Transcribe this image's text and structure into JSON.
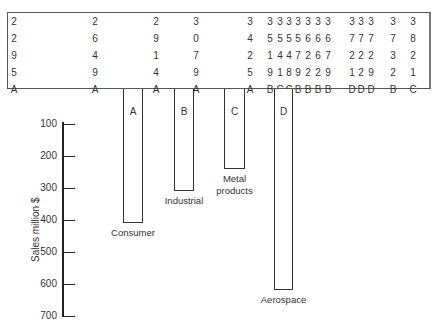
{
  "table": {
    "columns": [
      {
        "x": 14,
        "digits": [
          "2",
          "2",
          "9",
          "5"
        ],
        "letter": "A"
      },
      {
        "x": 95,
        "digits": [
          "2",
          "6",
          "4",
          "9"
        ],
        "letter": "A"
      },
      {
        "x": 156,
        "digits": [
          "2",
          "9",
          "1",
          "4"
        ],
        "letter": "A"
      },
      {
        "x": 196,
        "digits": [
          "3",
          "0",
          "7",
          "9"
        ],
        "letter": "A"
      },
      {
        "x": 250,
        "digits": [
          "3",
          "4",
          "2",
          "5"
        ],
        "letter": "A"
      },
      {
        "x": 270,
        "digits": [
          "3",
          "5",
          "1",
          "9"
        ],
        "letter": "B"
      },
      {
        "x": 280,
        "digits": [
          "3",
          "5",
          "4",
          "1"
        ],
        "letter": "C"
      },
      {
        "x": 289,
        "digits": [
          "3",
          "5",
          "4",
          "8"
        ],
        "letter": "C"
      },
      {
        "x": 298,
        "digits": [
          "3",
          "5",
          "7",
          "9"
        ],
        "letter": "B"
      },
      {
        "x": 308,
        "digits": [
          "3",
          "6",
          "2",
          "2"
        ],
        "letter": "B"
      },
      {
        "x": 318,
        "digits": [
          "3",
          "6",
          "6",
          "2"
        ],
        "letter": "B"
      },
      {
        "x": 328,
        "digits": [
          "3",
          "6",
          "7",
          "9"
        ],
        "letter": "B"
      },
      {
        "x": 352,
        "digits": [
          "3",
          "7",
          "2",
          "1"
        ],
        "letter": "D"
      },
      {
        "x": 361,
        "digits": [
          "3",
          "7",
          "2",
          "2"
        ],
        "letter": "D"
      },
      {
        "x": 371,
        "digits": [
          "3",
          "7",
          "2",
          "9"
        ],
        "letter": "D"
      },
      {
        "x": 393,
        "digits": [
          "3",
          "7",
          "3",
          "2"
        ],
        "letter": "B"
      },
      {
        "x": 413,
        "digits": [
          "3",
          "8",
          "2",
          "1"
        ],
        "letter": "C"
      }
    ]
  },
  "chart_data": {
    "type": "bar",
    "orientation": "hanging-down",
    "title": "",
    "ylabel": "Sales million $",
    "xlabel": "",
    "ylim": [
      0,
      700
    ],
    "yticks": [
      100,
      200,
      300,
      400,
      500,
      600,
      700
    ],
    "categories": [
      "Consumer",
      "Industrial",
      "Metal products",
      "Aerospace"
    ],
    "bar_letters": [
      "A",
      "B",
      "C",
      "D"
    ],
    "values": [
      410,
      310,
      240,
      620
    ],
    "grid": false,
    "legend": null
  },
  "axis": {
    "label": "Sales million $",
    "ticks": [
      "100",
      "200",
      "300",
      "400",
      "500",
      "600",
      "700"
    ]
  },
  "bars": [
    {
      "letter": "A",
      "label": "Consumer",
      "value": 410
    },
    {
      "letter": "B",
      "label": "Industrial",
      "value": 310
    },
    {
      "letter": "C",
      "label": "Metal\nproducts",
      "value": 240
    },
    {
      "letter": "D",
      "label": "Aerospace",
      "value": 620
    }
  ]
}
